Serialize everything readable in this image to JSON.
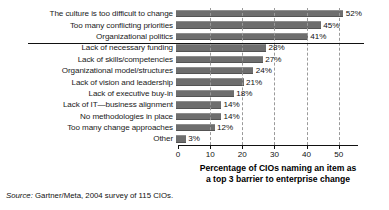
{
  "chart_data": {
    "type": "bar",
    "orientation": "horizontal",
    "title": "",
    "xlabel": "Percentage of CIOs naming an item as a top 3 barrier to enterprise change",
    "xlabel_lines": [
      "Percentage of CIOs naming an item as",
      "a top 3 barrier to enterprise change"
    ],
    "ylabel": "",
    "xlim": [
      0,
      56
    ],
    "xticks": [
      0,
      10,
      20,
      30,
      40,
      50
    ],
    "xticklabels": [
      "0",
      "10",
      "20",
      "30",
      "40",
      "50"
    ],
    "grid": "vertical-dashed",
    "legend": "none",
    "value_suffix": "%",
    "bar_color": "#6e6e6e",
    "categories": [
      "The culture is too difficult to change",
      "Too many conflicting priorities",
      "Organizational politics",
      "Lack of necessary funding",
      "Lack of skills/competencies",
      "Organizational model/structures",
      "Lack of vision and leadership",
      "Lack of executive buy-in",
      "Lack of IT—business alignment",
      "No methodologies in place",
      "Too many change approaches",
      "Other"
    ],
    "values": [
      52,
      45,
      41,
      28,
      27,
      24,
      21,
      18,
      14,
      14,
      12,
      3
    ],
    "value_labels": [
      "52%",
      "45%",
      "41%",
      "28%",
      "27%",
      "24%",
      "21%",
      "18%",
      "14%",
      "14%",
      "12%",
      "3%"
    ],
    "groups": [
      {
        "name": "top-barriers",
        "start_index": 0,
        "count": 3
      },
      {
        "name": "other-barriers",
        "start_index": 3,
        "count": 9
      }
    ],
    "separator_after_index": 2
  },
  "source": {
    "keyword": "Source:",
    "text": " Gartner/Meta, 2004 survey of 115 CIOs."
  }
}
